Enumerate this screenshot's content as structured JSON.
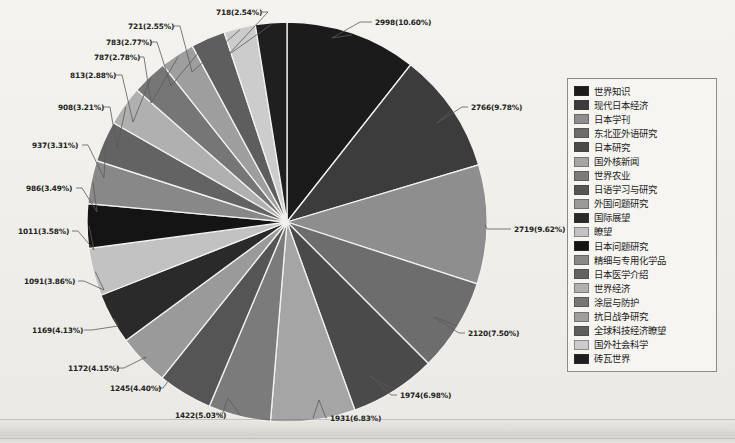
{
  "chart_data": {
    "type": "pie",
    "title": "",
    "subtitle": "",
    "xlabel": "",
    "ylabel": "",
    "legend_position": "right",
    "grid": false,
    "total": 28286,
    "categories": [
      "世界知识",
      "现代日本经济",
      "日本学刊",
      "东北亚外语研究",
      "日本研究",
      "国外核新闻",
      "世界农业",
      "日语学习与研究",
      "外国问题研究",
      "国际展望",
      "瞭望",
      "日本问题研究",
      "精细与专用化学品",
      "日本医学介绍",
      "世界经济",
      "涂层与防护",
      "抗日战争研究",
      "全球科技经济瞭望",
      "国外社会科学",
      "砖瓦世界"
    ],
    "values": [
      2998,
      2766,
      2719,
      2120,
      1974,
      1931,
      1422,
      1245,
      1172,
      1169,
      1091,
      1011,
      986,
      937,
      908,
      813,
      787,
      783,
      721,
      718
    ],
    "percents": [
      "10.60%",
      "9.78%",
      "9.62%",
      "7.50%",
      "6.98%",
      "6.83%",
      "5.03%",
      "4.40%",
      "4.15%",
      "4.13%",
      "3.86%",
      "3.58%",
      "3.49%",
      "3.31%",
      "3.21%",
      "2.88%",
      "2.78%",
      "2.77%",
      "2.55%",
      "2.54%"
    ],
    "data_labels": [
      "2998(10.60%)",
      "2766(9.78%)",
      "2719(9.62%)",
      "2120(7.50%)",
      "1974(6.98%)",
      "1931(6.83%)",
      "1422(5.03%)",
      "1245(4.40%)",
      "1172(4.15%)",
      "1169(4.13%)",
      "1091(3.86%)",
      "1011(3.58%)",
      "986(3.49%)",
      "937(3.31%)",
      "908(3.21%)",
      "813(2.88%)",
      "787(2.78%)",
      "783(2.77%)",
      "721(2.55%)",
      "718(2.54%)"
    ],
    "colors": [
      "#1b1b1b",
      "#3c3c3c",
      "#8e8e8e",
      "#6d6d6d",
      "#4a4a4a",
      "#a5a5a5",
      "#7b7b7b",
      "#555555",
      "#9a9a9a",
      "#2a2a2a",
      "#c2c2c2",
      "#141414",
      "#888888",
      "#636363",
      "#b0b0b0",
      "#767676",
      "#9e9e9e",
      "#5e5e5e",
      "#cccccc",
      "#1f1f1f"
    ]
  },
  "legend": {
    "items": [
      {
        "label": "世界知识",
        "color": "#1b1b1b"
      },
      {
        "label": "现代日本经济",
        "color": "#3c3c3c"
      },
      {
        "label": "日本学刊",
        "color": "#8e8e8e"
      },
      {
        "label": "东北亚外语研究",
        "color": "#6d6d6d"
      },
      {
        "label": "日本研究",
        "color": "#4a4a4a"
      },
      {
        "label": "国外核新闻",
        "color": "#a5a5a5"
      },
      {
        "label": "世界农业",
        "color": "#7b7b7b"
      },
      {
        "label": "日语学习与研究",
        "color": "#555555"
      },
      {
        "label": "外国问题研究",
        "color": "#9a9a9a"
      },
      {
        "label": "国际展望",
        "color": "#2a2a2a"
      },
      {
        "label": "瞭望",
        "color": "#c2c2c2"
      },
      {
        "label": "日本问题研究",
        "color": "#141414"
      },
      {
        "label": "精细与专用化学品",
        "color": "#888888"
      },
      {
        "label": "日本医学介绍",
        "color": "#636363"
      },
      {
        "label": "世界经济",
        "color": "#b0b0b0"
      },
      {
        "label": "涂层与防护",
        "color": "#767676"
      },
      {
        "label": "抗日战争研究",
        "color": "#9e9e9e"
      },
      {
        "label": "全球科技经济瞭望",
        "color": "#5e5e5e"
      },
      {
        "label": "国外社会科学",
        "color": "#cccccc"
      },
      {
        "label": "砖瓦世界",
        "color": "#1f1f1f"
      }
    ]
  },
  "label_positions": [
    {
      "i": 0,
      "x": 375,
      "y": 22,
      "anchor": "start",
      "lx1": 332,
      "ly1": 38,
      "lx2": 360,
      "ly2": 22,
      "lx3": 372,
      "ly3": 22
    },
    {
      "i": 1,
      "x": 471,
      "y": 107,
      "anchor": "start",
      "lx1": 437,
      "ly1": 123,
      "lx2": 462,
      "ly2": 107,
      "lx3": 468,
      "ly3": 107
    },
    {
      "i": 2,
      "x": 514,
      "y": 229,
      "anchor": "start",
      "lx1": 487,
      "ly1": 229,
      "lx2": 505,
      "ly2": 229,
      "lx3": 511,
      "ly3": 229
    },
    {
      "i": 3,
      "x": 468,
      "y": 333,
      "anchor": "start",
      "lx1": 434,
      "ly1": 317,
      "lx2": 459,
      "ly2": 333,
      "lx3": 465,
      "ly3": 333
    },
    {
      "i": 4,
      "x": 400,
      "y": 395,
      "anchor": "start",
      "lx1": 370,
      "ly1": 376,
      "lx2": 391,
      "ly2": 395,
      "lx3": 397,
      "ly3": 395
    },
    {
      "i": 5,
      "x": 330,
      "y": 418,
      "anchor": "start",
      "lx1": 319,
      "ly1": 400,
      "lx2": 326,
      "ly2": 418,
      "lx3": 327,
      "ly3": 418
    },
    {
      "i": 6,
      "x": 175,
      "y": 415,
      "anchor": "start",
      "lx1": 228,
      "ly1": 398,
      "lx2": 222,
      "ly2": 415,
      "lx3": 219,
      "ly3": 415
    },
    {
      "i": 7,
      "x": 110,
      "y": 388,
      "anchor": "start",
      "lx1": 172,
      "ly1": 376,
      "lx2": 163,
      "ly2": 388,
      "lx3": 157,
      "ly3": 388
    },
    {
      "i": 8,
      "x": 68,
      "y": 368,
      "anchor": "start",
      "lx1": 146,
      "ly1": 357,
      "lx2": 124,
      "ly2": 368,
      "lx3": 116,
      "ly3": 368
    },
    {
      "i": 9,
      "x": 32,
      "y": 330,
      "anchor": "start",
      "lx1": 118,
      "ly1": 326,
      "lx2": 92,
      "ly2": 330,
      "lx3": 84,
      "ly3": 330
    },
    {
      "i": 10,
      "x": 24,
      "y": 281,
      "anchor": "start",
      "lx1": 104,
      "ly1": 290,
      "lx2": 84,
      "ly2": 281,
      "lx3": 78,
      "ly3": 281
    },
    {
      "i": 11,
      "x": 18,
      "y": 231,
      "anchor": "start",
      "lx1": 94,
      "ly1": 250,
      "lx2": 78,
      "ly2": 231,
      "lx3": 72,
      "ly3": 231
    },
    {
      "i": 12,
      "x": 26,
      "y": 188,
      "anchor": "start",
      "lx1": 97,
      "ly1": 212,
      "lx2": 82,
      "ly2": 188,
      "lx3": 76,
      "ly3": 188
    },
    {
      "i": 13,
      "x": 32,
      "y": 145,
      "anchor": "start",
      "lx1": 104,
      "ly1": 178,
      "lx2": 88,
      "ly2": 145,
      "lx3": 82,
      "ly3": 145
    },
    {
      "i": 14,
      "x": 58,
      "y": 107,
      "anchor": "start",
      "lx1": 117,
      "ly1": 148,
      "lx2": 110,
      "ly2": 107,
      "lx3": 104,
      "ly3": 107
    },
    {
      "i": 15,
      "x": 70,
      "y": 75,
      "anchor": "start",
      "lx1": 133,
      "ly1": 122,
      "lx2": 122,
      "ly2": 75,
      "lx3": 116,
      "ly3": 75
    },
    {
      "i": 16,
      "x": 94,
      "y": 57,
      "anchor": "start",
      "lx1": 151,
      "ly1": 103,
      "lx2": 144,
      "ly2": 57,
      "lx3": 140,
      "ly3": 57
    },
    {
      "i": 17,
      "x": 106,
      "y": 42,
      "anchor": "start",
      "lx1": 171,
      "ly1": 86,
      "lx2": 157,
      "ly2": 42,
      "lx3": 152,
      "ly3": 42
    },
    {
      "i": 18,
      "x": 128,
      "y": 26,
      "anchor": "start",
      "lx1": 192,
      "ly1": 72,
      "lx2": 180,
      "ly2": 26,
      "lx3": 174,
      "ly3": 26
    },
    {
      "i": 19,
      "x": 216,
      "y": 12,
      "anchor": "start",
      "lx1": 228,
      "ly1": 55,
      "lx2": 268,
      "ly2": 12,
      "lx3": 262,
      "ly3": 12
    }
  ],
  "geometry": {
    "cx": 287,
    "cy": 222,
    "r": 200
  }
}
